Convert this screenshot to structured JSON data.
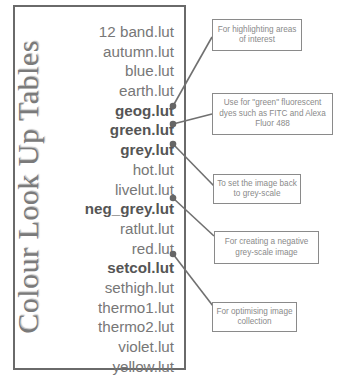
{
  "title": "Colour Look Up Tables",
  "lut_files": [
    {
      "name": "12 band.lut",
      "highlighted": false
    },
    {
      "name": "autumn.lut",
      "highlighted": false
    },
    {
      "name": "blue.lut",
      "highlighted": false
    },
    {
      "name": "earth.lut",
      "highlighted": false
    },
    {
      "name": "geog.lut",
      "highlighted": true
    },
    {
      "name": "green.lut",
      "highlighted": true
    },
    {
      "name": "grey.lut",
      "highlighted": true
    },
    {
      "name": "hot.lut",
      "highlighted": false
    },
    {
      "name": "livelut.lut",
      "highlighted": false
    },
    {
      "name": "neg_grey.lut",
      "highlighted": true
    },
    {
      "name": "ratlut.lut",
      "highlighted": false
    },
    {
      "name": "red.lut",
      "highlighted": false
    },
    {
      "name": "setcol.lut",
      "highlighted": true
    },
    {
      "name": "sethigh.lut",
      "highlighted": false
    },
    {
      "name": "thermo1.lut",
      "highlighted": false
    },
    {
      "name": "thermo2.lut",
      "highlighted": false
    },
    {
      "name": "violet.lut",
      "highlighted": false
    },
    {
      "name": "yellow.lut",
      "highlighted": false
    }
  ],
  "callouts": [
    {
      "target": "geog.lut",
      "text": "For highlighting areas of interest"
    },
    {
      "target": "green.lut",
      "text": "Use for \"green\" fluorescent dyes such as FITC and Alexa Fluor 488"
    },
    {
      "target": "grey.lut",
      "text": "To set the image back to grey-scale"
    },
    {
      "target": "neg_grey.lut",
      "text": "For creating a negative grey-scale image"
    },
    {
      "target": "setcol.lut",
      "text": "For optimising image collection"
    }
  ],
  "colors": {
    "line": "#707070",
    "text": "#777777",
    "bold_text": "#555555",
    "frame": "#6a6a6a"
  }
}
